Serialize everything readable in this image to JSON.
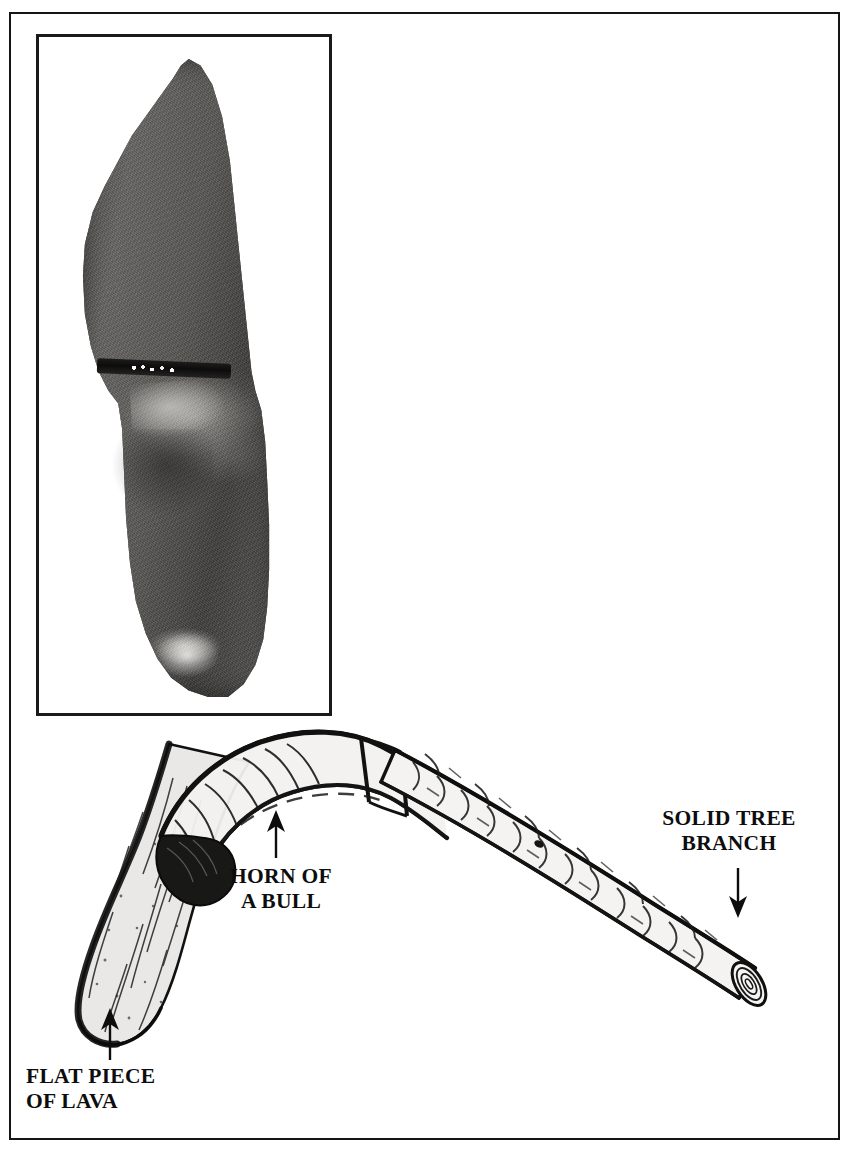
{
  "page": {
    "kind": "illustrated-figure-page",
    "background_color": "#ffffff",
    "border_color": "#151515"
  },
  "photo": {
    "name": "photograph-of-lava-rock",
    "caption": "",
    "frame_border_color": "#1a1a1a",
    "subject": "flat dark piece of lava rock",
    "tone": "grayscale"
  },
  "diagram": {
    "name": "bull-horn-and-branch-tool-diagram",
    "ink_color": "#101010",
    "parts": [
      {
        "id": "horn",
        "label": "HORN OF\nA BULL",
        "arrow": "up"
      },
      {
        "id": "branch",
        "label": "SOLID TREE\nBRANCH",
        "arrow": "down"
      },
      {
        "id": "lava",
        "label": "FLAT PIECE\nOF LAVA",
        "arrow": "up"
      }
    ]
  },
  "labels": {
    "horn": "HORN OF\nA BULL",
    "branch": "SOLID TREE\nBRANCH",
    "lava": "FLAT PIECE\nOF LAVA"
  }
}
